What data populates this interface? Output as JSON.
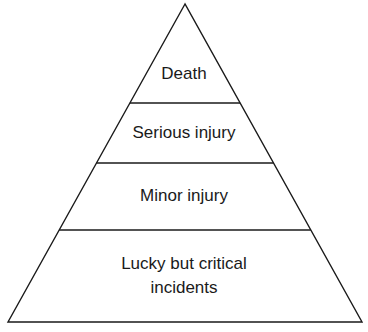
{
  "diagram": {
    "type": "pyramid",
    "colors": {
      "stroke": "#1a1a1a",
      "fill": "#ffffff",
      "text": "#1a1a1a"
    },
    "levels": [
      {
        "label": "Death",
        "order": 1
      },
      {
        "label": "Serious injury",
        "order": 2
      },
      {
        "label": "Minor injury",
        "order": 3
      },
      {
        "label": "Lucky but critical incidents",
        "lines": [
          "Lucky but critical",
          "incidents"
        ],
        "order": 4
      }
    ]
  }
}
